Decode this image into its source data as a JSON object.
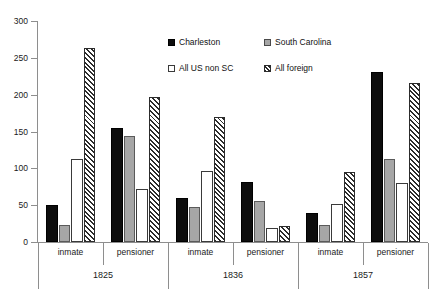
{
  "chart_data": {
    "type": "bar",
    "title": "",
    "subtitle": "",
    "xlabel": "",
    "ylabel": "",
    "ylim": [
      0,
      300
    ],
    "ytick_values": [
      0,
      50,
      100,
      150,
      200,
      250,
      300
    ],
    "ytick_labels": [
      "0",
      "50",
      "100",
      "150",
      "200",
      "250",
      "300"
    ],
    "grid": false,
    "legend_position": "top-center-inside",
    "group_labels": [
      "1825",
      "1836",
      "1857"
    ],
    "subgroup_labels": [
      "inmate",
      "pensioner"
    ],
    "categories": [
      "1825 inmate",
      "1825 pensioner",
      "1836 inmate",
      "1836 pensioner",
      "1857 inmate",
      "1857 pensioner"
    ],
    "series": [
      {
        "name": "Charleston",
        "key": "charleston",
        "color": "#0d0d0d",
        "fill": "solid-black",
        "values": [
          50,
          155,
          60,
          81,
          39,
          231
        ]
      },
      {
        "name": "South Carolina",
        "key": "sc",
        "color": "#a6a6a6",
        "fill": "solid-gray",
        "values": [
          23,
          144,
          48,
          56,
          23,
          113
        ]
      },
      {
        "name": "All US non SC",
        "key": "us",
        "color": "#ffffff",
        "fill": "solid-white",
        "values": [
          113,
          72,
          97,
          19,
          52,
          80
        ]
      },
      {
        "name": "All foreign",
        "key": "foreign",
        "color": "#2b2b2b",
        "fill": "diagonal-hatch",
        "values": [
          264,
          197,
          170,
          22,
          95,
          216
        ]
      }
    ]
  },
  "legend": {
    "entries": [
      {
        "label": "Charleston",
        "key": "charleston"
      },
      {
        "label": "South Carolina",
        "key": "sc"
      },
      {
        "label": "All US non SC",
        "key": "us"
      },
      {
        "label": "All foreign",
        "key": "foreign"
      }
    ]
  }
}
